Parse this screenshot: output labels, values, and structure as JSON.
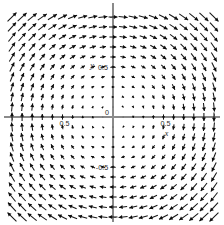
{
  "figure": {
    "kind": "vector-field-quiver-plot",
    "background_color": "#ffffff",
    "arrow_color": "#0d0d0d",
    "axis_color": "#8a8a8a",
    "width_px": 224,
    "height_px": 225
  },
  "axes": {
    "x_axis_label": "x",
    "y_axis_label": "y",
    "origin_label": "0",
    "x_tick_labels": [
      "-1",
      "-0.5",
      "0.5",
      "1"
    ],
    "y_tick_labels": [
      "0.5",
      "-0.5"
    ],
    "visible_tick_text": {
      "x_neg_half": "0.5",
      "x_pos_half": "0.5",
      "y_pos_half": "0.5",
      "y_neg_half": "-0.5",
      "origin": "0"
    },
    "origin_px": {
      "x": 113,
      "y": 117
    },
    "pixels_per_unit": {
      "x": 101,
      "y": 100
    }
  },
  "chart_data": {
    "type": "scatter",
    "subtype": "quiver",
    "title": "",
    "xlabel": "x",
    "ylabel": "y",
    "xlim": [
      -1,
      1
    ],
    "ylim": [
      -1,
      1
    ],
    "grid": false,
    "legend": null,
    "grid_points": 21,
    "field_formula": "u = y, v = -x (clockwise rotational field)",
    "rotation_sense": "clockwise",
    "magnitude_rule": "proportional to distance from origin",
    "sampled_directions": {
      "top_center": "left",
      "bottom_center": "right",
      "left_center": "down",
      "right_center": "up",
      "top_left_corner": "up-right",
      "top_right_corner": "up-right",
      "bottom_left_corner": "down-left",
      "bottom_right_corner": "up-right"
    },
    "x_ticks": [
      -1,
      -0.5,
      0,
      0.5,
      1
    ],
    "y_ticks": [
      -1,
      -0.5,
      0,
      0.5,
      1
    ]
  }
}
